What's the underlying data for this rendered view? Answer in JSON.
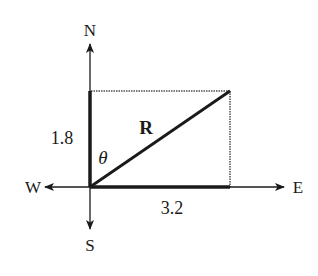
{
  "diagram": {
    "type": "vector-addition",
    "compass": {
      "north": "N",
      "south": "S",
      "east": "E",
      "west": "W"
    },
    "vertical_component": {
      "label": "1.8",
      "direction": "north"
    },
    "horizontal_component": {
      "label": "3.2",
      "direction": "east"
    },
    "resultant": {
      "label": "R"
    },
    "angle": {
      "label": "θ",
      "measured_from": "north"
    },
    "colors": {
      "ink": "#1a1a1a",
      "dotted_edge": "#7a7a7a",
      "background": "#ffffff"
    }
  }
}
